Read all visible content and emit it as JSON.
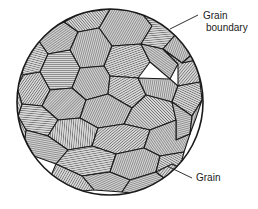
{
  "figure": {
    "background_color": "#ffffff",
    "line_color": "#1a1a1a",
    "hatch_color": "#2b2b2b",
    "grain_fill": "#d9d9d9",
    "circle": {
      "cx": 110,
      "cy": 102,
      "r": 93
    }
  },
  "callouts": {
    "grain_boundary": {
      "label_line1": "Grain",
      "label_line2": "boundary",
      "text_x": 203,
      "text_y": 19,
      "leader": {
        "x1": 170,
        "y1": 29,
        "x2": 198,
        "y2": 15
      }
    },
    "grain": {
      "label": "Grain",
      "text_x": 196,
      "text_y": 181,
      "leader": {
        "x1": 167,
        "y1": 166,
        "x2": 192,
        "y2": 178
      }
    }
  },
  "grains": [
    {
      "id": "g01",
      "angle": 30,
      "spacing": 2.0,
      "points": "110,9 140,11 152,26 141,44 112,46 99,28"
    },
    {
      "id": "g02",
      "angle": 85,
      "spacing": 2.2,
      "points": "140,11 166,19 176,34 163,49 141,44 152,26"
    },
    {
      "id": "g03",
      "angle": 20,
      "spacing": 2.0,
      "points": "166,19 186,33 195,52 182,63 163,49 176,34"
    },
    {
      "id": "g04",
      "angle": 140,
      "spacing": 2.1,
      "points": "110,9 99,28 78,32 64,22 80,13"
    },
    {
      "id": "g05",
      "angle": 55,
      "spacing": 2.0,
      "points": "64,22 78,32 70,50 48,54 38,40 47,29"
    },
    {
      "id": "g06",
      "angle": 105,
      "spacing": 2.2,
      "points": "38,40 48,54 40,72 23,75 19,56 27,45"
    },
    {
      "id": "g07",
      "angle": 15,
      "spacing": 2.0,
      "points": "99,28 112,46 104,66 80,68 70,50 78,32"
    },
    {
      "id": "g08",
      "angle": 70,
      "spacing": 2.1,
      "points": "112,46 141,44 150,62 138,78 110,76 104,66"
    },
    {
      "id": "g09",
      "angle": 125,
      "spacing": 2.0,
      "points": "141,44 163,49 178,64 170,79 150,62"
    },
    {
      "id": "g10",
      "angle": 40,
      "spacing": 2.2,
      "points": "163,49 182,63 196,60 200,82 178,86 178,64"
    },
    {
      "id": "g11",
      "angle": 90,
      "spacing": 2.0,
      "points": "70,50 80,68 72,88 50,90 40,72 48,54"
    },
    {
      "id": "g12",
      "angle": 35,
      "spacing": 2.1,
      "points": "23,75 40,72 50,90 42,106 22,104 17,88"
    },
    {
      "id": "g13",
      "angle": 150,
      "spacing": 2.0,
      "points": "80,68 104,66 110,76 108,94 86,100 72,88"
    },
    {
      "id": "g14",
      "angle": 60,
      "spacing": 2.2,
      "points": "110,76 138,78 146,95 132,108 108,94"
    },
    {
      "id": "g15",
      "angle": 10,
      "spacing": 2.0,
      "points": "138,78 170,79 178,86 172,102 146,95"
    },
    {
      "id": "g16",
      "angle": 115,
      "spacing": 2.1,
      "points": "178,86 200,82 202,100 192,116 172,102"
    },
    {
      "id": "g17",
      "angle": 45,
      "spacing": 2.0,
      "points": "50,90 72,88 86,100 80,118 58,120 42,106"
    },
    {
      "id": "g18",
      "angle": 95,
      "spacing": 2.2,
      "points": "22,104 42,106 58,120 48,136 26,130 18,116"
    },
    {
      "id": "g19",
      "angle": 25,
      "spacing": 2.0,
      "points": "86,100 108,94 132,108 124,124 98,128 80,118"
    },
    {
      "id": "g20",
      "angle": 135,
      "spacing": 2.1,
      "points": "132,108 146,95 172,102 176,120 150,130 124,124"
    },
    {
      "id": "g21",
      "angle": 75,
      "spacing": 2.0,
      "points": "172,102 192,116 190,134 176,140 176,120"
    },
    {
      "id": "g22",
      "angle": 5,
      "spacing": 2.2,
      "points": "58,120 80,118 98,128 92,146 68,150 48,136"
    },
    {
      "id": "g23",
      "angle": 100,
      "spacing": 2.0,
      "points": "26,130 48,136 68,150 56,164 34,156 24,144"
    },
    {
      "id": "g24",
      "angle": 50,
      "spacing": 2.1,
      "points": "98,128 124,124 150,130 144,148 116,154 92,146"
    },
    {
      "id": "g25",
      "angle": 145,
      "spacing": 2.0,
      "points": "150,130 176,120 176,140 190,134 184,152 160,156 144,148"
    },
    {
      "id": "g26",
      "angle": 80,
      "spacing": 2.2,
      "points": "68,150 92,146 116,154 110,172 82,176 56,164"
    },
    {
      "id": "g27",
      "angle": 20,
      "spacing": 2.0,
      "points": "116,154 144,148 160,156 156,172 130,180 110,172"
    },
    {
      "id": "g28",
      "angle": 120,
      "spacing": 2.1,
      "points": "160,156 184,152 180,168 164,178 156,172"
    },
    {
      "id": "g29",
      "angle": 65,
      "spacing": 2.0,
      "points": "82,176 110,172 130,180 122,192 94,190"
    },
    {
      "id": "g30",
      "angle": 30,
      "spacing": 2.2,
      "points": "56,164 82,176 94,190 70,192 50,178"
    },
    {
      "id": "g31",
      "angle": 110,
      "spacing": 2.0,
      "points": "130,180 156,172 164,178 160,188 138,194 122,192"
    },
    {
      "id": "g32",
      "angle": 42,
      "spacing": 2.1,
      "points": "19,56 27,45 38,40 27,45 19,56"
    },
    {
      "id": "g33",
      "angle": 88,
      "spacing": 2.0,
      "points": "186,33 195,52 196,60 182,63 195,52"
    },
    {
      "id": "g34",
      "angle": 155,
      "spacing": 2.2,
      "points": "17,88 22,104 18,116 26,130 24,144 34,156 20,130 15,106"
    },
    {
      "id": "g35",
      "angle": 15,
      "spacing": 2.0,
      "points": "202,100 192,116 190,134 196,118"
    },
    {
      "id": "g36",
      "angle": 68,
      "spacing": 2.1,
      "points": "47,29 38,40 27,45 34,34"
    },
    {
      "id": "g37",
      "angle": 128,
      "spacing": 2.0,
      "points": "80,13 64,22 47,29 60,18"
    },
    {
      "id": "g38",
      "angle": 38,
      "spacing": 2.2,
      "points": "180,168 164,178 156,172 172,164"
    },
    {
      "id": "g39",
      "angle": 92,
      "spacing": 2.0,
      "points": "50,178 70,192 56,190 44,182"
    },
    {
      "id": "g40",
      "angle": 22,
      "spacing": 2.1,
      "points": "138,194 160,188 150,194 142,196"
    }
  ]
}
